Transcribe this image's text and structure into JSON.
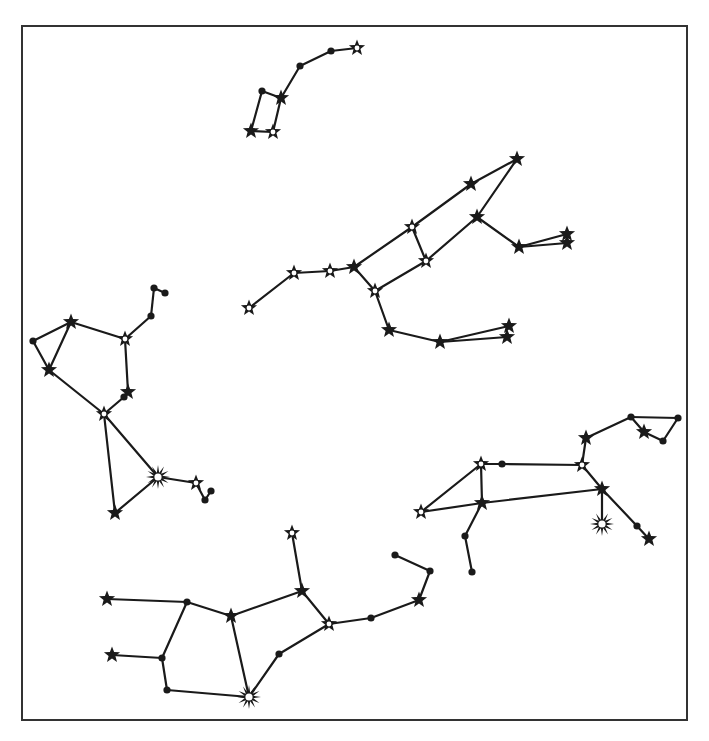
{
  "diagram": {
    "title": "",
    "frame": {
      "x": 22,
      "y": 26,
      "width": 665,
      "height": 694,
      "stroke": "#333333"
    },
    "colors": {
      "line": "#1a1a1a",
      "background": "#ffffff",
      "fill_hollow": "#ffffff"
    },
    "marker_types": {
      "dot": "small filled circle (faint star)",
      "star": "filled five-point star",
      "hollow_star": "five-point star with white center (brighter star)",
      "burst": "many-pointed starburst with white center (brightest star)"
    },
    "constellations": [
      {
        "name": "little-dipper",
        "stars": [
          {
            "id": "a1",
            "x": 251,
            "y": 131,
            "type": "star"
          },
          {
            "id": "a2",
            "x": 273,
            "y": 132,
            "type": "hollow_star"
          },
          {
            "id": "a3",
            "x": 262,
            "y": 91,
            "type": "dot"
          },
          {
            "id": "a4",
            "x": 281,
            "y": 98,
            "type": "star"
          },
          {
            "id": "a5",
            "x": 300,
            "y": 66,
            "type": "dot"
          },
          {
            "id": "a6",
            "x": 331,
            "y": 51,
            "type": "dot"
          },
          {
            "id": "a7",
            "x": 357,
            "y": 48,
            "type": "hollow_star"
          }
        ],
        "edges": [
          [
            "a1",
            "a2"
          ],
          [
            "a1",
            "a3"
          ],
          [
            "a3",
            "a4"
          ],
          [
            "a2",
            "a4"
          ],
          [
            "a4",
            "a5"
          ],
          [
            "a5",
            "a6"
          ],
          [
            "a6",
            "a7"
          ]
        ]
      },
      {
        "name": "big-dipper-bear",
        "stars": [
          {
            "id": "b1",
            "x": 249,
            "y": 308,
            "type": "hollow_star"
          },
          {
            "id": "b2",
            "x": 294,
            "y": 273,
            "type": "hollow_star"
          },
          {
            "id": "b3",
            "x": 330,
            "y": 271,
            "type": "hollow_star"
          },
          {
            "id": "b4",
            "x": 354,
            "y": 267,
            "type": "star"
          },
          {
            "id": "b5",
            "x": 412,
            "y": 227,
            "type": "hollow_star"
          },
          {
            "id": "b6",
            "x": 426,
            "y": 261,
            "type": "hollow_star"
          },
          {
            "id": "b7",
            "x": 375,
            "y": 291,
            "type": "hollow_star"
          },
          {
            "id": "b8",
            "x": 471,
            "y": 184,
            "type": "star"
          },
          {
            "id": "b9",
            "x": 517,
            "y": 159,
            "type": "star"
          },
          {
            "id": "b10",
            "x": 477,
            "y": 217,
            "type": "star"
          },
          {
            "id": "b11",
            "x": 519,
            "y": 247,
            "type": "star"
          },
          {
            "id": "b12",
            "x": 567,
            "y": 234,
            "type": "star"
          },
          {
            "id": "b13",
            "x": 567,
            "y": 243,
            "type": "star"
          },
          {
            "id": "b14",
            "x": 389,
            "y": 330,
            "type": "star"
          },
          {
            "id": "b15",
            "x": 440,
            "y": 342,
            "type": "star"
          },
          {
            "id": "b16",
            "x": 509,
            "y": 326,
            "type": "star"
          },
          {
            "id": "b17",
            "x": 507,
            "y": 337,
            "type": "star"
          }
        ],
        "edges": [
          [
            "b1",
            "b2"
          ],
          [
            "b2",
            "b3"
          ],
          [
            "b3",
            "b4"
          ],
          [
            "b4",
            "b5"
          ],
          [
            "b4",
            "b7"
          ],
          [
            "b5",
            "b6"
          ],
          [
            "b7",
            "b6"
          ],
          [
            "b5",
            "b8"
          ],
          [
            "b8",
            "b9"
          ],
          [
            "b9",
            "b10"
          ],
          [
            "b10",
            "b6"
          ],
          [
            "b10",
            "b11"
          ],
          [
            "b11",
            "b12"
          ],
          [
            "b11",
            "b13"
          ],
          [
            "b7",
            "b14"
          ],
          [
            "b14",
            "b15"
          ],
          [
            "b15",
            "b16"
          ],
          [
            "b15",
            "b17"
          ]
        ]
      },
      {
        "name": "left-figure",
        "stars": [
          {
            "id": "c1",
            "x": 154,
            "y": 288,
            "type": "dot"
          },
          {
            "id": "c2",
            "x": 165,
            "y": 293,
            "type": "dot"
          },
          {
            "id": "c3",
            "x": 151,
            "y": 316,
            "type": "dot"
          },
          {
            "id": "c4",
            "x": 125,
            "y": 339,
            "type": "hollow_star"
          },
          {
            "id": "c5",
            "x": 71,
            "y": 322,
            "type": "star"
          },
          {
            "id": "c6",
            "x": 33,
            "y": 341,
            "type": "dot"
          },
          {
            "id": "c7",
            "x": 49,
            "y": 370,
            "type": "star"
          },
          {
            "id": "c8",
            "x": 128,
            "y": 392,
            "type": "star"
          },
          {
            "id": "c9",
            "x": 124,
            "y": 397,
            "type": "dot"
          },
          {
            "id": "c10",
            "x": 104,
            "y": 414,
            "type": "hollow_star"
          },
          {
            "id": "c11",
            "x": 158,
            "y": 477,
            "type": "burst"
          },
          {
            "id": "c12",
            "x": 196,
            "y": 483,
            "type": "hollow_star"
          },
          {
            "id": "c13",
            "x": 211,
            "y": 491,
            "type": "dot"
          },
          {
            "id": "c14",
            "x": 205,
            "y": 500,
            "type": "dot"
          },
          {
            "id": "c15",
            "x": 115,
            "y": 513,
            "type": "star"
          }
        ],
        "edges": [
          [
            "c1",
            "c2"
          ],
          [
            "c1",
            "c3"
          ],
          [
            "c3",
            "c4"
          ],
          [
            "c4",
            "c5"
          ],
          [
            "c5",
            "c6"
          ],
          [
            "c5",
            "c7"
          ],
          [
            "c6",
            "c7"
          ],
          [
            "c4",
            "c8"
          ],
          [
            "c8",
            "c9"
          ],
          [
            "c9",
            "c10"
          ],
          [
            "c7",
            "c10"
          ],
          [
            "c10",
            "c11"
          ],
          [
            "c10",
            "c15"
          ],
          [
            "c15",
            "c11"
          ],
          [
            "c11",
            "c12"
          ],
          [
            "c12",
            "c14"
          ],
          [
            "c14",
            "c13"
          ]
        ]
      },
      {
        "name": "right-figure",
        "stars": [
          {
            "id": "d1",
            "x": 421,
            "y": 512,
            "type": "hollow_star"
          },
          {
            "id": "d2",
            "x": 481,
            "y": 464,
            "type": "hollow_star"
          },
          {
            "id": "d3",
            "x": 502,
            "y": 464,
            "type": "dot"
          },
          {
            "id": "d4",
            "x": 582,
            "y": 465,
            "type": "hollow_star"
          },
          {
            "id": "d5",
            "x": 586,
            "y": 438,
            "type": "star"
          },
          {
            "id": "d6",
            "x": 631,
            "y": 417,
            "type": "dot"
          },
          {
            "id": "d7",
            "x": 678,
            "y": 418,
            "type": "dot"
          },
          {
            "id": "d8",
            "x": 644,
            "y": 432,
            "type": "star"
          },
          {
            "id": "d9",
            "x": 663,
            "y": 441,
            "type": "dot"
          },
          {
            "id": "d10",
            "x": 482,
            "y": 503,
            "type": "star"
          },
          {
            "id": "d11",
            "x": 602,
            "y": 489,
            "type": "star"
          },
          {
            "id": "d12",
            "x": 602,
            "y": 524,
            "type": "burst"
          },
          {
            "id": "d13",
            "x": 637,
            "y": 526,
            "type": "dot"
          },
          {
            "id": "d14",
            "x": 649,
            "y": 539,
            "type": "star"
          },
          {
            "id": "d15",
            "x": 465,
            "y": 536,
            "type": "dot"
          },
          {
            "id": "d16",
            "x": 472,
            "y": 572,
            "type": "dot"
          }
        ],
        "edges": [
          [
            "d1",
            "d2"
          ],
          [
            "d2",
            "d3"
          ],
          [
            "d3",
            "d4"
          ],
          [
            "d4",
            "d5"
          ],
          [
            "d5",
            "d6"
          ],
          [
            "d6",
            "d7"
          ],
          [
            "d6",
            "d8"
          ],
          [
            "d8",
            "d9"
          ],
          [
            "d9",
            "d7"
          ],
          [
            "d2",
            "d10"
          ],
          [
            "d1",
            "d10"
          ],
          [
            "d10",
            "d11"
          ],
          [
            "d4",
            "d11"
          ],
          [
            "d11",
            "d12"
          ],
          [
            "d11",
            "d13"
          ],
          [
            "d13",
            "d14"
          ],
          [
            "d10",
            "d15"
          ],
          [
            "d15",
            "d16"
          ]
        ]
      },
      {
        "name": "bottom-figure",
        "stars": [
          {
            "id": "e1",
            "x": 107,
            "y": 599,
            "type": "star"
          },
          {
            "id": "e2",
            "x": 187,
            "y": 602,
            "type": "dot"
          },
          {
            "id": "e3",
            "x": 231,
            "y": 616,
            "type": "star"
          },
          {
            "id": "e4",
            "x": 302,
            "y": 591,
            "type": "star"
          },
          {
            "id": "e5",
            "x": 292,
            "y": 533,
            "type": "hollow_star"
          },
          {
            "id": "e6",
            "x": 329,
            "y": 624,
            "type": "hollow_star"
          },
          {
            "id": "e7",
            "x": 371,
            "y": 618,
            "type": "dot"
          },
          {
            "id": "e8",
            "x": 419,
            "y": 600,
            "type": "star"
          },
          {
            "id": "e9",
            "x": 430,
            "y": 571,
            "type": "dot"
          },
          {
            "id": "e10",
            "x": 395,
            "y": 555,
            "type": "dot"
          },
          {
            "id": "e11",
            "x": 112,
            "y": 655,
            "type": "star"
          },
          {
            "id": "e12",
            "x": 162,
            "y": 658,
            "type": "dot"
          },
          {
            "id": "e13",
            "x": 167,
            "y": 690,
            "type": "dot"
          },
          {
            "id": "e14",
            "x": 249,
            "y": 697,
            "type": "burst"
          },
          {
            "id": "e15",
            "x": 279,
            "y": 654,
            "type": "dot"
          }
        ],
        "edges": [
          [
            "e1",
            "e2"
          ],
          [
            "e2",
            "e3"
          ],
          [
            "e3",
            "e4"
          ],
          [
            "e4",
            "e5"
          ],
          [
            "e4",
            "e6"
          ],
          [
            "e6",
            "e7"
          ],
          [
            "e7",
            "e8"
          ],
          [
            "e8",
            "e9"
          ],
          [
            "e9",
            "e10"
          ],
          [
            "e2",
            "e12"
          ],
          [
            "e11",
            "e12"
          ],
          [
            "e12",
            "e13"
          ],
          [
            "e13",
            "e14"
          ],
          [
            "e3",
            "e14"
          ],
          [
            "e14",
            "e15"
          ],
          [
            "e15",
            "e6"
          ]
        ]
      }
    ]
  }
}
